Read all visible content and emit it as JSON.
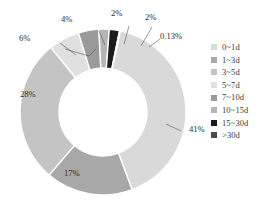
{
  "chart_data": {
    "type": "pie",
    "variant": "donut",
    "title": "",
    "subtitle": "",
    "xlabel": "",
    "ylabel": "",
    "grid": false,
    "legend_position": "right",
    "categories": [
      "0~1d",
      "1~3d",
      "3~5d",
      "5~7d",
      "7~10d",
      "10~15d",
      "15~30d",
      ">30d"
    ],
    "values": [
      41,
      17,
      28,
      6,
      4,
      2,
      2,
      0.13
    ],
    "data_labels": [
      "41%",
      "17%",
      "28%",
      "6%",
      "4%",
      "2%",
      "2%",
      "0.13%"
    ],
    "colors": [
      "#d9d9d9",
      "#a8a8a8",
      "#c4c4c4",
      "#e0e0e0",
      "#9a9a9a",
      "#b5b5b5",
      "#1c1c1c",
      "#4a4a4a"
    ],
    "series": [
      {
        "name": "Duration distribution",
        "points": [
          {
            "label": "0~1d",
            "value": 41,
            "display": "41%",
            "color": "#d9d9d9"
          },
          {
            "label": "1~3d",
            "value": 17,
            "display": "17%",
            "color": "#a8a8a8"
          },
          {
            "label": "3~5d",
            "value": 28,
            "display": "28%",
            "color": "#c4c4c4"
          },
          {
            "label": "5~7d",
            "value": 6,
            "display": "6%",
            "color": "#e0e0e0"
          },
          {
            "label": "7~10d",
            "value": 4,
            "display": "4%",
            "color": "#9a9a9a"
          },
          {
            "label": "10~15d",
            "value": 2,
            "display": "2%",
            "color": "#b5b5b5"
          },
          {
            "label": "15~30d",
            "value": 2,
            "display": "2%",
            "color": "#1c1c1c"
          },
          {
            "label": ">30d",
            "value": 0.13,
            "display": "0.13%",
            "color": "#4a4a4a"
          }
        ]
      }
    ]
  },
  "legend": {
    "items": [
      {
        "label": "0~1d",
        "color": "#d9d9d9"
      },
      {
        "label": "1~3d",
        "color": "#a8a8a8"
      },
      {
        "label": "3~5d",
        "color": "#c4c4c4"
      },
      {
        "label": "5~7d",
        "color": "#e0e0e0"
      },
      {
        "label": "7~10d",
        "color": "#9a9a9a"
      },
      {
        "label": "10~15d",
        "color": "#b5b5b5"
      },
      {
        "label": "15~30d",
        "color": "#1c1c1c"
      },
      {
        "label": ">30d",
        "color": "#4a4a4a"
      }
    ]
  },
  "labels": {
    "pct_41": "41%",
    "pct_17": "17%",
    "pct_28": "28%",
    "pct_6": "6%",
    "pct_4": "4%",
    "pct_2a": "2%",
    "pct_2b": "2%",
    "pct_013": "0.13%"
  }
}
